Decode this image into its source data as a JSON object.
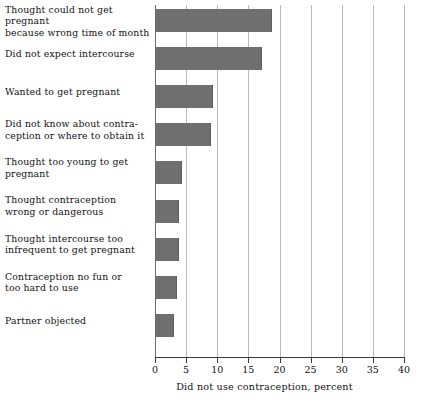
{
  "chart_data": {
    "type": "bar",
    "orientation": "horizontal",
    "title": "",
    "subtitle": "",
    "xlabel": "Did not use contraception, percent",
    "ylabel": "",
    "xlim": [
      0,
      40
    ],
    "xticks": [
      0,
      5,
      10,
      15,
      20,
      25,
      30,
      35,
      40
    ],
    "xtick_labels": [
      "0",
      "5",
      "10",
      "15",
      "20",
      "25",
      "30",
      "35",
      "40"
    ],
    "grid": "vertical",
    "legend": "none",
    "bar_color": "#6f6f6f",
    "categories": [
      "Thought could not get pregnant\nbecause wrong time of month",
      "Did not expect intercourse",
      "Wanted to get pregnant",
      "Did not know about contra-\nception or where to obtain it",
      "Thought too young to get\npregnant",
      "Thought contraception\nwrong or dangerous",
      "Thought intercourse too\ninfrequent to get pregnant",
      "Contraception no fun or\ntoo hard to use",
      "Partner objected"
    ],
    "values": [
      18.6,
      17.0,
      9.2,
      8.8,
      4.2,
      3.7,
      3.7,
      3.4,
      2.9
    ]
  }
}
